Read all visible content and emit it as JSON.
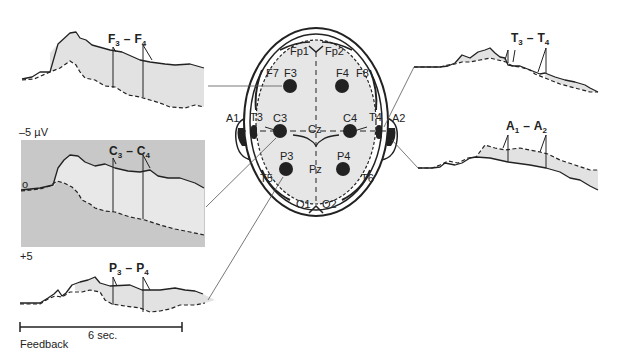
{
  "figure": {
    "traces": [
      {
        "id": "F",
        "label_a": "F",
        "sub_a": "3",
        "dash": "–",
        "label_b": "F",
        "sub_b": "4"
      },
      {
        "id": "C",
        "label_a": "C",
        "sub_a": "3",
        "dash": "–",
        "label_b": "C",
        "sub_b": "4"
      },
      {
        "id": "P",
        "label_a": "P",
        "sub_a": "3",
        "dash": "–",
        "label_b": "P",
        "sub_b": "4"
      },
      {
        "id": "T",
        "label_a": "T",
        "sub_a": "3",
        "dash": "–",
        "label_b": "T",
        "sub_b": "4"
      },
      {
        "id": "A",
        "label_a": "A",
        "sub_a": "1",
        "dash": "–",
        "label_b": "A",
        "sub_b": "2"
      }
    ],
    "axis": {
      "top_label": "–5 µV",
      "zero_label": "o",
      "bottom_label": "+5"
    },
    "timescale": {
      "label": "6 sec.",
      "caption": "Feedback"
    },
    "electrodes": {
      "Fp1": "Fp1",
      "Fp2": "Fp2",
      "F7": "F7",
      "F3": "F3",
      "F4": "F4",
      "F8": "F8",
      "A1": "A1",
      "T3": "T3",
      "C3": "C3",
      "Cz": "Cz",
      "C4": "C4",
      "T4": "T4",
      "A2": "A2",
      "P3": "P3",
      "Pz": "Pz",
      "P4": "P4",
      "T5": "T5",
      "T6": "T6",
      "O1": "O1",
      "O2": "O2"
    },
    "colors": {
      "box_fill": "#c8c8c8",
      "area_fill": "#e2e2e2",
      "head_fill": "#e6e6e6",
      "ink": "#222222"
    }
  }
}
